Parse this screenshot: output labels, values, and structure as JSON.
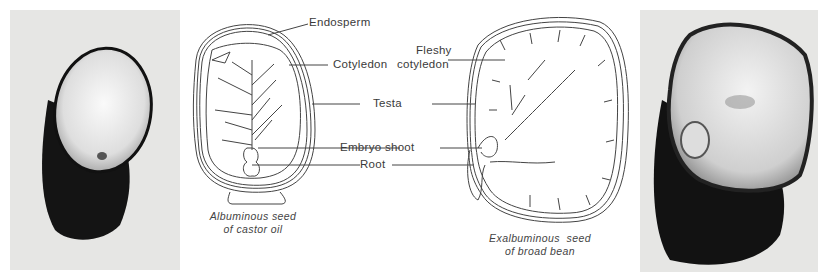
{
  "figure": {
    "left_photo": {
      "subject": "castor oil seed cut section photo"
    },
    "right_photo": {
      "subject": "broad bean seed cut section photo"
    },
    "labels": {
      "endosperm": "Endosperm",
      "cotyledon": "Cotyledon",
      "fleshy_cotyledon_line1": "Fleshy",
      "fleshy_cotyledon_line2": "cotyledon",
      "testa": "Testa",
      "embryo_shoot": "Embryo shoot",
      "root": "Root"
    },
    "captions": {
      "castor_line1": "Albuminous seed",
      "castor_line2": "of castor oil",
      "bean_line1": "Exalbuminous  seed",
      "bean_line2": "of broad bean"
    }
  }
}
